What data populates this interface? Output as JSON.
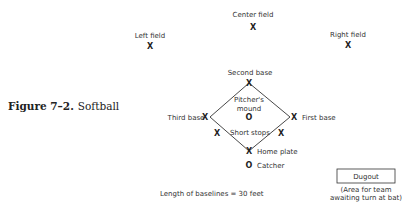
{
  "caption": {
    "figure": "Figure 7–2.",
    "title": "Softball"
  },
  "positions": {
    "center_field": "Center field",
    "left_field": "Left field",
    "right_field": "Right field",
    "second_base": "Second base",
    "pitchers_mound_line1": "Pitcher's",
    "pitchers_mound_line2": "mound",
    "third_base": "Third base",
    "first_base": "First base",
    "short_stops": "Short stops",
    "home_plate": "Home plate",
    "catcher": "Catcher"
  },
  "markers": {
    "player": "X",
    "circle": "O"
  },
  "baselines_note": "Length of baselines = 30 feet",
  "dugout": {
    "label": "Dugout",
    "note_line1": "(Area for team",
    "note_line2": "awaiting turn at bat)"
  }
}
